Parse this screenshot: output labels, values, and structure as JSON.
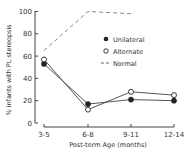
{
  "chart_data": {
    "type": "line",
    "title": "",
    "xlabel": "Post-term Age (months)",
    "ylabel": "% infants with PL stereopsis",
    "ylim": [
      0,
      100
    ],
    "yticks": [
      0,
      20,
      40,
      60,
      80,
      100
    ],
    "categories": [
      "3-5",
      "6-8",
      "9-11",
      "12-14"
    ],
    "grid": false,
    "legend_position": "upper right (inside plot)",
    "series": [
      {
        "name": "Unilateral",
        "marker": "filled-circle",
        "line": "solid",
        "values": [
          53,
          17,
          21,
          20
        ]
      },
      {
        "name": "Alternate",
        "marker": "open-circle",
        "line": "solid",
        "values": [
          57,
          12,
          28,
          25
        ]
      },
      {
        "name": "Normal",
        "marker": "none",
        "line": "dashed",
        "values": [
          65,
          100,
          98,
          null
        ]
      }
    ]
  },
  "axes": {
    "ylabel": "% infants with PL stereopsis",
    "xlabel": "Post-term Age (months)",
    "yticks": [
      "0",
      "20",
      "40",
      "60",
      "80",
      "100"
    ],
    "xticks": [
      "3-5",
      "6-8",
      "9-11",
      "12-14"
    ]
  },
  "legend": {
    "items": [
      {
        "label": "Unilateral",
        "symbol": "●"
      },
      {
        "label": "Alternate",
        "symbol": "○"
      },
      {
        "label": "Normal",
        "symbol": "--"
      }
    ]
  },
  "colors": {
    "ink": "#333333",
    "dashed": "#888888",
    "background": "#ffffff"
  }
}
